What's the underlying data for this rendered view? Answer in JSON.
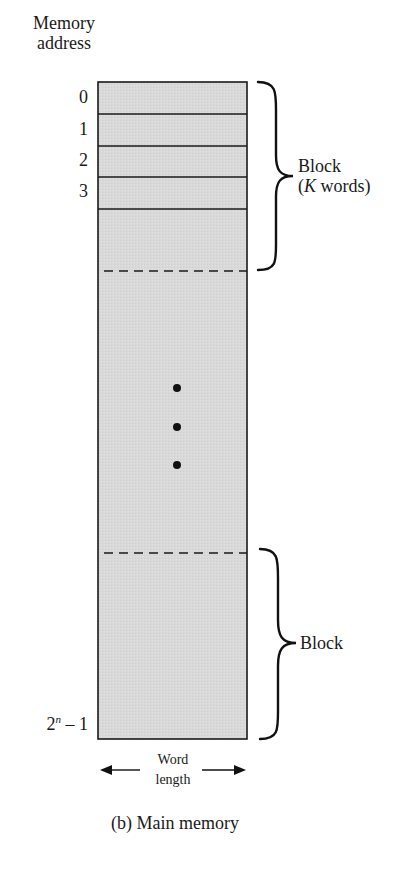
{
  "header": {
    "line1": "Memory",
    "line2": "address"
  },
  "addresses": [
    "0",
    "1",
    "2",
    "3"
  ],
  "last_address": {
    "base": "2",
    "exponent": "n",
    "suffix": " – 1"
  },
  "brace_top": {
    "line1": "Block",
    "line2_open": "(",
    "line2_italic": "K",
    "line2_rest": " words)"
  },
  "brace_bottom": {
    "label": "Block"
  },
  "width_label": {
    "line1": "Word",
    "line2": "length"
  },
  "caption": "(b) Main memory",
  "colors": {
    "cell_fill": "#d9d9d9",
    "line": "#1a1a1a",
    "background": "#ffffff"
  }
}
